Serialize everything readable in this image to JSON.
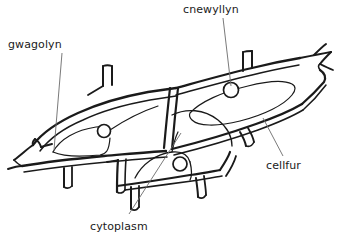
{
  "diagram": {
    "type": "biological-diagram",
    "colors": {
      "background": "#ffffff",
      "cell_wall_stroke": "#1a1a1a",
      "nucleus_stroke": "#1a1a1a",
      "leader_line_stroke": "#6b6b6b",
      "label_text": "#1a1a1a"
    },
    "labels": [
      {
        "id": "gwagolyn",
        "text": "gwagolyn",
        "position": {
          "x": 8,
          "y": 39
        },
        "leader": {
          "x1": 62,
          "y1": 53,
          "x2": 54,
          "y2": 150
        }
      },
      {
        "id": "cnewyllyn",
        "text": "cnewyllyn",
        "position": {
          "x": 183,
          "y": 4
        },
        "leader": {
          "x1": 223,
          "y1": 18,
          "x2": 231,
          "y2": 86
        }
      },
      {
        "id": "cellfur",
        "text": "cellfur",
        "position": {
          "x": 266,
          "y": 160
        },
        "leader": {
          "x1": 263,
          "y1": 118,
          "x2": 283,
          "y2": 156
        }
      },
      {
        "id": "cytoplasm",
        "text": "cytoplasm",
        "position": {
          "x": 90,
          "y": 221
        },
        "leader": {
          "x1": 129,
          "y1": 214,
          "x2": 181,
          "y2": 133
        }
      }
    ],
    "nuclei": [
      {
        "id": "nucleus-left",
        "cx": 104,
        "cy": 131,
        "r": 6.5
      },
      {
        "id": "nucleus-middle",
        "cx": 180,
        "cy": 164,
        "r": 7.0
      },
      {
        "id": "nucleus-right",
        "cx": 231,
        "cy": 90,
        "r": 7.5
      }
    ],
    "cells": [
      {
        "id": "cell-left",
        "label": "left cell"
      },
      {
        "id": "cell-right",
        "label": "right cell"
      },
      {
        "id": "cell-bottom",
        "label": "bottom cell"
      }
    ]
  }
}
